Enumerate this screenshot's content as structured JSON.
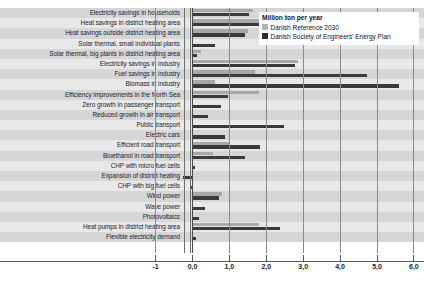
{
  "chart_data": {
    "type": "bar",
    "orientation": "horizontal",
    "title": "",
    "xlabel": "",
    "ylabel": "",
    "legend_title": "Million ton per year",
    "legend_position": "top-right",
    "grid": true,
    "xlim": [
      -1.0,
      6.0
    ],
    "xticks": [
      "-1",
      "0,0",
      "1,0",
      "2,0",
      "3,0",
      "4,0",
      "5,0",
      "6,0"
    ],
    "xtick_values": [
      -1.0,
      0.0,
      1.0,
      2.0,
      3.0,
      4.0,
      5.0,
      6.0
    ],
    "categories": [
      "Electricity savings in households",
      "Heat savings in district heating area",
      "Heat savings outside district heating area",
      "Solar thermal, small individual plants",
      "Solar thermal, big plants in district heating area",
      "Electricity savings in industry",
      "Fuel savings in industry",
      "Biomass in industry",
      "Efficiency improvements in the North Sea",
      "Zero growth in passenger transport",
      "Reduced growth in air transport",
      "Public transport",
      "Electric cars",
      "Efficient road transport",
      "Bioethanol in road transport",
      "CHP with micro fuel cells",
      "Expansion of district heating",
      "CHP with big fuel cells",
      "Wind power",
      "Wave power",
      "Photovoltaics",
      "Heat pumps in district heating area",
      "Flexible electricity demand"
    ],
    "series": [
      {
        "name": "Danish Reference 2030",
        "color": "#a8a8a8",
        "values": [
          1.63,
          3.15,
          1.5,
          0.0,
          0.22,
          2.85,
          1.7,
          0.6,
          1.79,
          0.0,
          0.0,
          0.0,
          0.0,
          1.0,
          0.55,
          0.0,
          0.0,
          0.0,
          0.8,
          0.0,
          0.0,
          1.8,
          0.0
        ]
      },
      {
        "name": "Danish Society of Engineers' Energy Plan",
        "color": "#3a3a3a",
        "values": [
          1.52,
          2.79,
          1.43,
          0.6,
          0.12,
          2.79,
          4.73,
          5.6,
          0.96,
          0.78,
          0.42,
          2.47,
          0.89,
          1.82,
          1.43,
          0.07,
          -0.25,
          -0.05,
          0.73,
          0.33,
          0.18,
          2.38,
          0.1
        ]
      }
    ]
  },
  "legend": {
    "title": "Million ton per year",
    "items": [
      {
        "label": "Danish Reference 2030"
      },
      {
        "label": "Danish Society of Engineers' Energy Plan"
      }
    ]
  }
}
